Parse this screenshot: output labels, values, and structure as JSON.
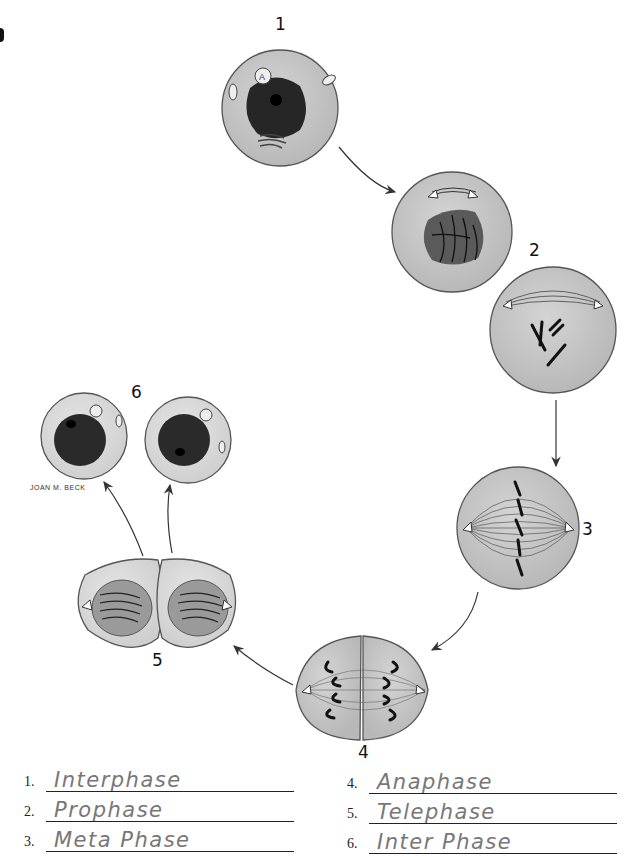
{
  "stages": [
    {
      "id": "1",
      "label": "1"
    },
    {
      "id": "2",
      "label": "2"
    },
    {
      "id": "3",
      "label": "3"
    },
    {
      "id": "4",
      "label": "4"
    },
    {
      "id": "5",
      "label": "5"
    },
    {
      "id": "6",
      "label": "6"
    }
  ],
  "artist_credit": "JOAN M. BECK",
  "answers": [
    {
      "number": "1.",
      "value": "Interphase"
    },
    {
      "number": "2.",
      "value": "Prophase"
    },
    {
      "number": "3.",
      "value": "Meta Phase"
    },
    {
      "number": "4.",
      "value": "Anaphase"
    },
    {
      "number": "5.",
      "value": "Telephase"
    },
    {
      "number": "6.",
      "value": "Inter Phase"
    }
  ],
  "colors": {
    "cytoplasm": "#c9c9c9",
    "cytoplasm_light": "#dedede",
    "nucleus": "#2a2a2a",
    "outline": "#555555",
    "handwriting": "#777777"
  }
}
